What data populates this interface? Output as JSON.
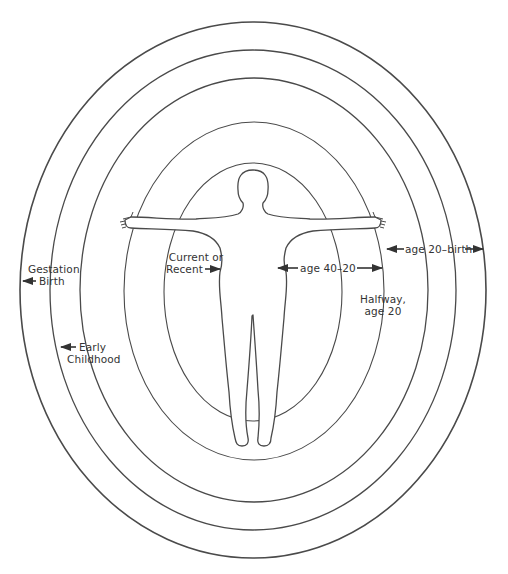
{
  "diagram": {
    "line_color": "#4a4a4a",
    "text_color": "#333333",
    "rings": [
      {
        "id": "ring-current",
        "cx": 253,
        "cy": 292,
        "rx": 89,
        "ry": 129
      },
      {
        "id": "ring-halfway",
        "cx": 254,
        "cy": 291,
        "rx": 130,
        "ry": 169
      },
      {
        "id": "ring-age20",
        "cx": 254,
        "cy": 290,
        "rx": 174,
        "ry": 212
      },
      {
        "id": "ring-early-childhood",
        "cx": 253,
        "cy": 290,
        "rx": 203,
        "ry": 240
      },
      {
        "id": "ring-gestation",
        "cx": 253,
        "cy": 290,
        "rx": 233,
        "ry": 268
      }
    ],
    "labels": {
      "gestation_line1": "Gestation",
      "gestation_line2": "Birth",
      "early_line1": "Early",
      "early_line2": "Childhood",
      "current_line1": "Current or",
      "current_line2": "Recent",
      "age_40_20": "age 40–20",
      "halfway_line1": "Halfway,",
      "halfway_line2": "age 20",
      "age_20_birth": "age 20–birth"
    }
  }
}
